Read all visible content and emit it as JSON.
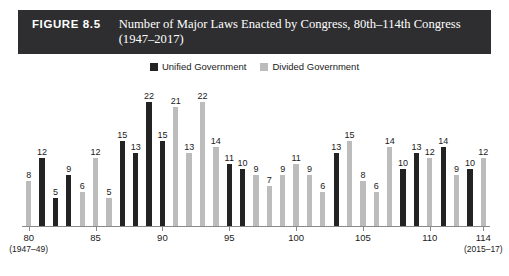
{
  "figure": {
    "number": "FIGURE 8.5",
    "title": "Number of Major Laws Enacted by Congress, 80th–114th Congress (1947–2017)"
  },
  "legend": {
    "position": "top-center",
    "entries": [
      {
        "label": "Unified Government",
        "color": "#232323"
      },
      {
        "label": "Divided Government",
        "color": "#bcbcbc"
      }
    ]
  },
  "colors": {
    "unified": "#232323",
    "divided": "#bcbcbc",
    "title_bar": "#2e2e30",
    "axis": "#8a8a8a",
    "text": "#1a1a1a"
  },
  "chart_data": {
    "type": "bar",
    "title": "Number of Major Laws Enacted by Congress, 80th–114th Congress (1947–2017)",
    "xlabel": "",
    "ylabel": "",
    "ylim": [
      0,
      23
    ],
    "grid": false,
    "legend_position": "top-center",
    "categories": [
      "80",
      "81",
      "82",
      "83",
      "84",
      "85",
      "86",
      "87",
      "88",
      "89",
      "90",
      "91",
      "92",
      "93",
      "94",
      "95",
      "96",
      "97",
      "98",
      "99",
      "100",
      "101",
      "102",
      "103",
      "104",
      "105",
      "106",
      "107",
      "108",
      "109",
      "110",
      "111",
      "112",
      "113",
      "114"
    ],
    "values": [
      8,
      12,
      5,
      9,
      6,
      12,
      5,
      15,
      13,
      22,
      15,
      21,
      13,
      22,
      14,
      11,
      10,
      9,
      7,
      9,
      11,
      9,
      6,
      13,
      15,
      8,
      6,
      14,
      10,
      13,
      12,
      14,
      9,
      10,
      12
    ],
    "series_of_bar": [
      "divided",
      "unified",
      "unified",
      "unified",
      "divided",
      "divided",
      "divided",
      "unified",
      "unified",
      "unified",
      "unified",
      "divided",
      "divided",
      "divided",
      "divided",
      "unified",
      "unified",
      "divided",
      "divided",
      "divided",
      "divided",
      "divided",
      "divided",
      "unified",
      "divided",
      "divided",
      "divided",
      "divided",
      "unified",
      "unified",
      "divided",
      "unified",
      "divided",
      "unified",
      "divided"
    ],
    "series": [
      {
        "name": "Unified Government",
        "color": "#232323"
      },
      {
        "name": "Divided Government",
        "color": "#bcbcbc"
      }
    ],
    "xticks": [
      {
        "value": "80",
        "sublabel": "(1947–49)",
        "index": 0
      },
      {
        "value": "85",
        "sublabel": "",
        "index": 5
      },
      {
        "value": "90",
        "sublabel": "",
        "index": 10
      },
      {
        "value": "95",
        "sublabel": "",
        "index": 15
      },
      {
        "value": "100",
        "sublabel": "",
        "index": 20
      },
      {
        "value": "105",
        "sublabel": "",
        "index": 25
      },
      {
        "value": "110",
        "sublabel": "",
        "index": 30
      },
      {
        "value": "114",
        "sublabel": "(2015–17)",
        "index": 34
      }
    ]
  }
}
